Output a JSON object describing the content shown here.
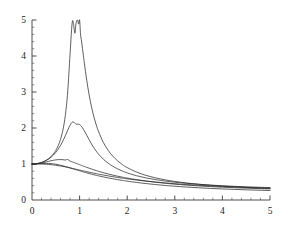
{
  "chart_data": {
    "type": "line",
    "title": "",
    "subtitle": "",
    "xlabel": "",
    "ylabel": "",
    "xlim": [
      0,
      5
    ],
    "ylim": [
      0,
      5
    ],
    "grid": false,
    "legend": "none",
    "annotations": [],
    "x_ticks": [
      {
        "value": 0,
        "label": "0"
      },
      {
        "value": 1,
        "label": "1"
      },
      {
        "value": 2,
        "label": "2"
      },
      {
        "value": 3,
        "label": "3"
      },
      {
        "value": 4,
        "label": "4"
      },
      {
        "value": 5,
        "label": "5"
      }
    ],
    "y_ticks": [
      {
        "value": 0,
        "label": "0"
      },
      {
        "value": 1,
        "label": "1"
      },
      {
        "value": 2,
        "label": "2"
      },
      {
        "value": 3,
        "label": "3"
      },
      {
        "value": 4,
        "label": "4"
      },
      {
        "value": 5,
        "label": "5"
      }
    ],
    "x_minor_step": 0.2,
    "y_minor_step": 0.2,
    "x": [
      0,
      0.05,
      0.1,
      0.15,
      0.2,
      0.25,
      0.3,
      0.35,
      0.4,
      0.45,
      0.5,
      0.55,
      0.6,
      0.65,
      0.7,
      0.75,
      0.8,
      0.85,
      0.9,
      0.92,
      0.94,
      0.96,
      0.98,
      1.0,
      1.02,
      1.04,
      1.06,
      1.08,
      1.1,
      1.15,
      1.2,
      1.25,
      1.3,
      1.35,
      1.4,
      1.5,
      1.6,
      1.7,
      1.8,
      1.9,
      2.0,
      2.2,
      2.4,
      2.6,
      2.8,
      3.0,
      3.25,
      3.5,
      3.75,
      4.0,
      4.25,
      4.5,
      4.75,
      5.0
    ],
    "series": [
      {
        "name": "curve-1",
        "peak_x": 1.0,
        "peak_y": 5.0,
        "values": [
          1.0,
          1.0026,
          1.0104,
          1.0238,
          1.0433,
          1.0697,
          1.1043,
          1.149,
          1.2064,
          1.2806,
          1.3777,
          1.508,
          1.6884,
          1.9489,
          2.3477,
          3.0,
          4.0632,
          4.9712,
          4.6322,
          4.8654,
          4.9836,
          4.9902,
          4.8859,
          5.0,
          4.6055,
          4.4178,
          4.2129,
          4.0043,
          3.7992,
          3.3276,
          2.9231,
          2.5878,
          2.3122,
          2.0847,
          1.895,
          1.5973,
          1.3793,
          1.2143,
          1.0858,
          0.9834,
          0.9002,
          0.7741,
          0.6826,
          0.6133,
          0.5591,
          0.5156,
          0.4726,
          0.4382,
          0.4101,
          0.3867,
          0.3669,
          0.35,
          0.3353,
          0.3225
        ]
      },
      {
        "name": "curve-2",
        "peak_x": 1.0,
        "peak_y": 2.1,
        "values": [
          1.0,
          1.0025,
          1.0101,
          1.023,
          1.0417,
          1.0666,
          1.0987,
          1.1389,
          1.1886,
          1.2492,
          1.3228,
          1.4116,
          1.5177,
          1.6424,
          1.7842,
          1.936,
          2.0787,
          2.1661,
          2.1385,
          2.1122,
          2.1032,
          2.1098,
          2.1033,
          2.1,
          2.0702,
          2.0444,
          2.0062,
          1.9649,
          1.9181,
          1.7989,
          1.6748,
          1.5568,
          1.4498,
          1.3548,
          1.2711,
          1.1321,
          1.0228,
          0.9351,
          0.8634,
          0.8037,
          0.7533,
          0.673,
          0.6122,
          0.5644,
          0.526,
          0.4943,
          0.4621,
          0.4358,
          0.414,
          0.3957,
          0.38,
          0.3665,
          0.3547,
          0.3443
        ]
      },
      {
        "name": "curve-3",
        "peak_x": 0.75,
        "peak_y": 1.26,
        "values": [
          1.0,
          1.0018,
          1.0071,
          1.0157,
          1.0273,
          1.0414,
          1.0572,
          1.0736,
          1.0895,
          1.1036,
          1.1147,
          1.1215,
          1.1233,
          1.1196,
          1.1106,
          1.1256,
          1.0799,
          1.0568,
          1.032,
          1.0219,
          1.0117,
          1.0015,
          0.9913,
          0.9811,
          0.971,
          0.9609,
          0.9509,
          0.9409,
          0.9311,
          0.9068,
          0.8832,
          0.8604,
          0.8384,
          0.8172,
          0.7968,
          0.7585,
          0.7233,
          0.691,
          0.6614,
          0.6341,
          0.609,
          0.5646,
          0.5265,
          0.4937,
          0.4651,
          0.4401,
          0.4137,
          0.3913,
          0.3722,
          0.3557,
          0.3414,
          0.3288,
          0.3177,
          0.3078
        ]
      },
      {
        "name": "curve-4",
        "peak_x": 0.0,
        "peak_y": 1.0,
        "values": [
          1.0,
          1.0012,
          1.0043,
          1.0084,
          1.0125,
          1.0156,
          1.0168,
          1.0154,
          1.0112,
          1.004,
          0.9939,
          0.9812,
          0.9662,
          0.9494,
          0.9311,
          0.9118,
          0.8918,
          0.8714,
          0.851,
          0.8428,
          0.8347,
          0.8266,
          0.8186,
          0.8106,
          0.8027,
          0.7949,
          0.7872,
          0.7795,
          0.772,
          0.7535,
          0.7356,
          0.7183,
          0.7016,
          0.6856,
          0.6701,
          0.6409,
          0.6138,
          0.5887,
          0.5654,
          0.5437,
          0.5236,
          0.4875,
          0.456,
          0.4284,
          0.404,
          0.3824,
          0.3593,
          0.3394,
          0.3223,
          0.3073,
          0.2942,
          0.2826,
          0.2722,
          0.2629
        ]
      },
      {
        "name": "curve-5",
        "peak_x": 0.0,
        "peak_y": 1.0,
        "values": [
          1.0,
          1.0004,
          1.0007,
          1.0003,
          0.999,
          0.9966,
          0.9929,
          0.9879,
          0.9815,
          0.9739,
          0.965,
          0.955,
          0.9439,
          0.9319,
          0.9191,
          0.9056,
          0.8915,
          0.877,
          0.8622,
          0.8562,
          0.8502,
          0.8441,
          0.8381,
          0.832,
          0.826,
          0.82,
          0.814,
          0.808,
          0.8021,
          0.7874,
          0.773,
          0.7589,
          0.7451,
          0.7316,
          0.7185,
          0.6933,
          0.6696,
          0.6472,
          0.6262,
          0.6065,
          0.588,
          0.5543,
          0.5245,
          0.4979,
          0.4742,
          0.4529,
          0.4298,
          0.4095,
          0.3918,
          0.3761,
          0.3621,
          0.3496,
          0.3383,
          0.3281
        ]
      }
    ]
  },
  "style": {
    "background": "#ffffff",
    "curve_color": "#2b2b2b",
    "axis_color": "#3a3a3a",
    "label_color": "#1d1d1d"
  }
}
